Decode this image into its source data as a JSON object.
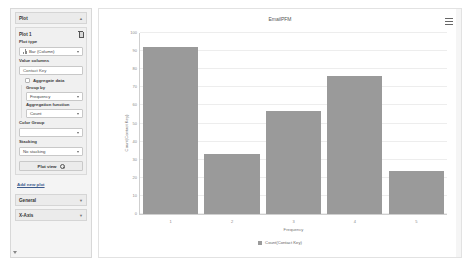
{
  "sidebar": {
    "panel_title": "Plot",
    "plot_card": {
      "name": "Plot 1",
      "delete_icon": "trash-icon"
    },
    "fields": {
      "plot_type_label": "Plot type",
      "plot_type_value": "Bar (Column)",
      "value_columns_label": "Value columns",
      "value_columns_value": "Contact Key",
      "aggregate_data_label": "Aggregate data",
      "group_by_label": "Group by",
      "group_by_value": "Frequency",
      "aggregation_function_label": "Aggregation function",
      "aggregation_function_value": "Count",
      "color_group_label": "Color Group",
      "color_group_value": "",
      "stacking_label": "Stacking",
      "stacking_value": "No stacking"
    },
    "plot_view_button": "Plot view",
    "add_new_plot_link": "Add new plot",
    "sections": [
      {
        "label": "General"
      },
      {
        "label": "X-Axis"
      }
    ]
  },
  "chart_panel": {
    "menu_icon": "hamburger-menu-icon"
  },
  "chart_data": {
    "type": "bar",
    "title": "EmailPFM",
    "categories": [
      "1",
      "2",
      "3",
      "4",
      "5"
    ],
    "values": [
      92,
      33,
      57,
      76,
      24
    ],
    "xlabel": "Frequency",
    "ylabel": "Count(Contact Key)",
    "ylim": [
      0,
      100
    ],
    "yticks": [
      0,
      10,
      20,
      30,
      40,
      50,
      60,
      70,
      80,
      90,
      100
    ],
    "grid": true,
    "legend": [
      {
        "name": "Count(Contact Key)",
        "color": "#9a9a9a"
      }
    ],
    "legend_position": "bottom",
    "bar_color": "#9a9a9a"
  }
}
